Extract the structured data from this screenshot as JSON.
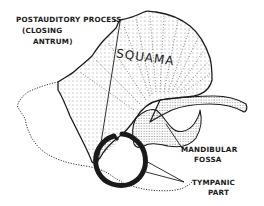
{
  "diagram": {
    "labels": {
      "postauditory_line1": "POSTAUDITORY PROCESS",
      "postauditory_line2": "(CLOSING",
      "postauditory_line3": "ANTRUM)",
      "squama": "SQUAMA",
      "mandibular_line1": "MANDIBULAR",
      "mandibular_line2": "FOSSA",
      "tympanic_line1": "TYMPANIC",
      "tympanic_line2": "PART"
    },
    "colors": {
      "ink": "#1a1a1a",
      "background": "#ffffff"
    }
  }
}
